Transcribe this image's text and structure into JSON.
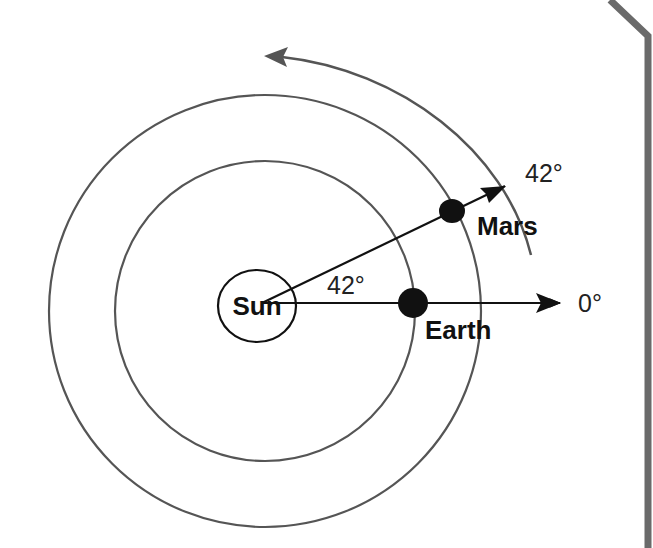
{
  "diagram": {
    "colors": {
      "orbit": "#555555",
      "body": "#111111",
      "motion_arrow": "#555555",
      "border": "#6a6a6a",
      "background": "#ffffff"
    },
    "labels": {
      "sun": "Sun",
      "earth": "Earth",
      "mars": "Mars",
      "angle_between": "42°",
      "mars_direction": "42°",
      "earth_direction": "0°"
    },
    "bodies": [
      {
        "name": "Sun",
        "position": "center"
      },
      {
        "name": "Earth",
        "orbit": "inner",
        "angle_deg": 0
      },
      {
        "name": "Mars",
        "orbit": "outer",
        "angle_deg": 42
      }
    ],
    "motion": "counterclockwise"
  }
}
